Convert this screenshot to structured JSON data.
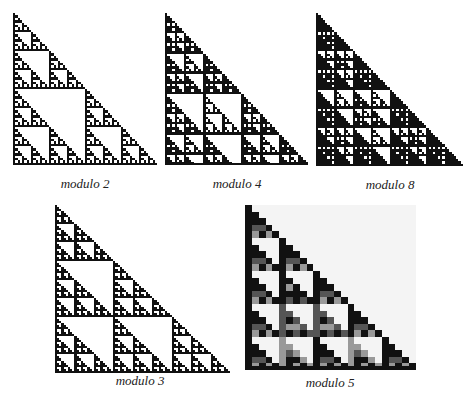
{
  "figures": [
    {
      "id": "mod2",
      "caption": "modulo 2",
      "modulus": 2,
      "rows": 64,
      "x": 13,
      "y": 13,
      "w": 144,
      "h": 152,
      "caption_x": 85,
      "caption_y": 176,
      "palette": [
        "#ffffff",
        "#111111"
      ]
    },
    {
      "id": "mod4",
      "caption": "modulo 4",
      "modulus": 4,
      "rows": 60,
      "x": 165,
      "y": 13,
      "w": 143,
      "h": 152,
      "caption_x": 237,
      "caption_y": 176,
      "palette": [
        "#ffffff",
        "#111111",
        "#111111",
        "#111111"
      ]
    },
    {
      "id": "mod8",
      "caption": "modulo 8",
      "modulus": 8,
      "rows": 64,
      "x": 316,
      "y": 13,
      "w": 147,
      "h": 153,
      "caption_x": 390,
      "caption_y": 177,
      "palette": [
        "#ffffff",
        "#111111",
        "#111111",
        "#111111",
        "#111111",
        "#111111",
        "#111111",
        "#111111"
      ]
    },
    {
      "id": "mod3",
      "caption": "modulo 3",
      "modulus": 3,
      "rows": 81,
      "x": 55,
      "y": 205,
      "w": 175,
      "h": 168,
      "caption_x": 140,
      "caption_y": 373,
      "palette": [
        "#ffffff",
        "#111111",
        "#111111"
      ]
    },
    {
      "id": "mod5",
      "caption": "modulo  5",
      "modulus": 5,
      "rows": 25,
      "x": 245,
      "y": 205,
      "w": 171,
      "h": 165,
      "caption_x": 330,
      "caption_y": 375,
      "palette": [
        "#f4f4f4",
        "#111111",
        "#111111",
        "#555555",
        "#999999"
      ]
    }
  ]
}
